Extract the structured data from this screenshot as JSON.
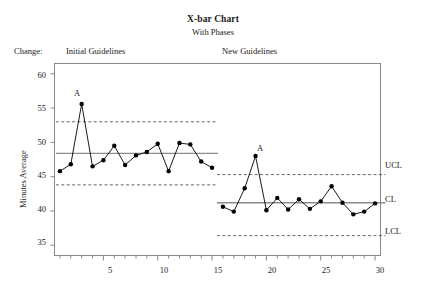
{
  "chart_data": {
    "type": "line",
    "title": "X-bar Chart",
    "subtitle": "With Phases",
    "xlabel": "",
    "ylabel": "Minutes Average",
    "xlim": [
      0.5,
      30.5
    ],
    "ylim": [
      33.5,
      61.5
    ],
    "grid": false,
    "legend_position": "none",
    "x_ticks_major": [
      5,
      10,
      15,
      20,
      25,
      30
    ],
    "x_ticks_minor_step": 1,
    "y_ticks": [
      35,
      40,
      45,
      50,
      55,
      60
    ],
    "phase_change_label": "Change:",
    "phases": [
      {
        "name": "Initial Guidelines",
        "x_start": 1,
        "x_end": 15,
        "center_line": 48.4,
        "upper_control_limit": 53.0,
        "lower_control_limit": 43.8,
        "x": [
          1,
          2,
          3,
          4,
          5,
          6,
          7,
          8,
          9,
          10,
          11,
          12,
          13,
          14,
          15
        ],
        "values": [
          45.8,
          46.8,
          55.6,
          46.5,
          47.4,
          49.5,
          46.7,
          48.1,
          48.6,
          49.8,
          45.8,
          49.9,
          49.7,
          47.2,
          46.3
        ],
        "violations": [
          {
            "x": 3,
            "y": 55.6,
            "label": "A"
          }
        ]
      },
      {
        "name": "New Guidelines",
        "x_start": 16,
        "x_end": 30,
        "center_line": 41.2,
        "upper_control_limit": 45.3,
        "lower_control_limit": 36.4,
        "x": [
          16,
          17,
          18,
          19,
          20,
          21,
          22,
          23,
          24,
          25,
          26,
          27,
          28,
          29,
          30
        ],
        "values": [
          40.6,
          39.9,
          43.3,
          48.0,
          40.1,
          41.9,
          40.2,
          41.7,
          40.3,
          41.4,
          43.6,
          41.2,
          39.5,
          39.9,
          41.1
        ],
        "violations": [
          {
            "x": 19,
            "y": 48.0,
            "label": "A"
          }
        ]
      }
    ],
    "limit_labels": {
      "ucl": "UCL",
      "cl": "CL",
      "lcl": "LCL"
    },
    "colors": {
      "point": "#000000",
      "line": "#000000",
      "center_line": "#8c8c8c",
      "control_limit": "#555555",
      "frame": "#888888",
      "text": "#1a1a1a"
    }
  }
}
